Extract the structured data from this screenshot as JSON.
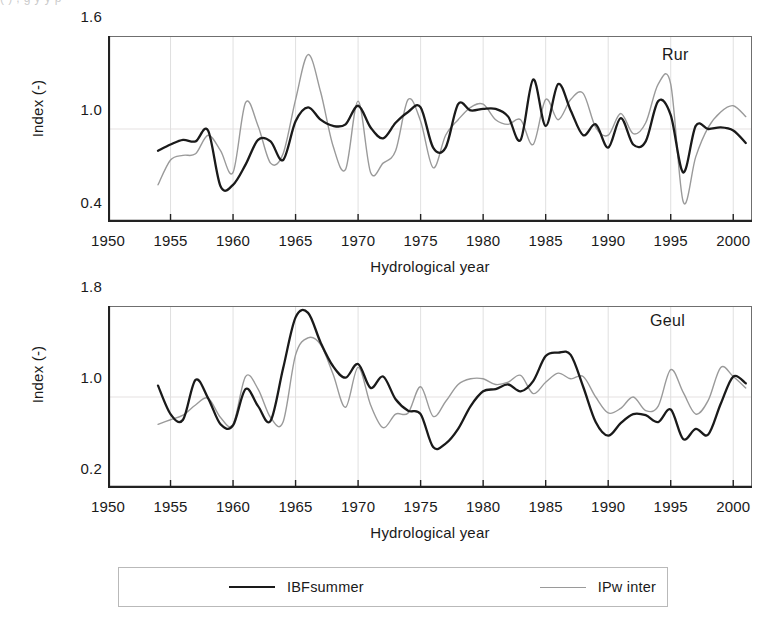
{
  "crop_artifact": {
    "text": "(  )   ,                                        g y            y  p"
  },
  "legend": {
    "entries": [
      {
        "label": "IBFsummer",
        "color": "#1a1a1a",
        "icon": "line-swatch"
      },
      {
        "label": "IPw inter",
        "color": "#9a9a9a",
        "icon": "line-swatch"
      }
    ]
  },
  "chart_data": [
    {
      "type": "line",
      "title": "Rur",
      "xlabel": "Hydrological year",
      "ylabel": "Index (-)",
      "xlim": [
        1950,
        2001.5
      ],
      "ylim": [
        0.4,
        1.6
      ],
      "xticks": [
        1950,
        1955,
        1960,
        1965,
        1970,
        1975,
        1980,
        1985,
        1990,
        1995,
        2000
      ],
      "yticks": [
        0.4,
        1.0,
        1.6
      ],
      "grid": true,
      "legend_position": "bottom-shared",
      "x": [
        1954,
        1955,
        1956,
        1957,
        1958,
        1959,
        1960,
        1961,
        1962,
        1963,
        1964,
        1965,
        1966,
        1967,
        1968,
        1969,
        1970,
        1971,
        1972,
        1973,
        1974,
        1975,
        1976,
        1977,
        1978,
        1979,
        1980,
        1981,
        1982,
        1983,
        1984,
        1985,
        1986,
        1987,
        1988,
        1989,
        1990,
        1991,
        1992,
        1993,
        1994,
        1995,
        1996,
        1997,
        1998,
        1999,
        2000,
        2001
      ],
      "series": [
        {
          "name": "IBFsummer",
          "color": "#1a1a1a",
          "values": [
            0.86,
            0.9,
            0.93,
            0.92,
            0.99,
            0.63,
            0.64,
            0.77,
            0.93,
            0.92,
            0.8,
            1.05,
            1.14,
            1.06,
            1.02,
            1.03,
            1.15,
            1.01,
            0.94,
            1.04,
            1.11,
            1.14,
            0.88,
            0.88,
            1.16,
            1.12,
            1.13,
            1.13,
            1.08,
            0.93,
            1.32,
            1.02,
            1.29,
            1.12,
            0.96,
            1.03,
            0.88,
            1.07,
            0.9,
            0.92,
            1.18,
            1.09,
            0.72,
            1.02,
            1.0,
            1.01,
            0.99,
            0.91
          ]
        },
        {
          "name": "IPw inter",
          "color": "#9a9a9a",
          "values": [
            0.64,
            0.8,
            0.83,
            0.84,
            0.96,
            0.86,
            0.72,
            1.17,
            1.02,
            0.78,
            0.84,
            1.19,
            1.48,
            1.24,
            0.89,
            0.74,
            1.18,
            0.72,
            0.78,
            0.86,
            1.19,
            1.05,
            0.75,
            0.96,
            1.06,
            1.14,
            1.16,
            1.06,
            1.03,
            1.06,
            0.9,
            1.19,
            1.06,
            1.19,
            1.23,
            1.01,
            0.96,
            1.1,
            0.97,
            1.04,
            1.29,
            1.29,
            0.53,
            0.82,
            1.01,
            1.11,
            1.15,
            1.08
          ]
        }
      ]
    },
    {
      "type": "line",
      "title": "Geul",
      "xlabel": "Hydrological year",
      "ylabel": "Index (-)",
      "xlim": [
        1950,
        2001.5
      ],
      "ylim": [
        0.2,
        1.8
      ],
      "xticks": [
        1950,
        1955,
        1960,
        1965,
        1970,
        1975,
        1980,
        1985,
        1990,
        1995,
        2000
      ],
      "yticks": [
        0.2,
        1.0,
        1.8
      ],
      "grid": true,
      "legend_position": "bottom-shared",
      "x": [
        1954,
        1955,
        1956,
        1957,
        1958,
        1959,
        1960,
        1961,
        1962,
        1963,
        1964,
        1965,
        1966,
        1967,
        1968,
        1969,
        1970,
        1971,
        1972,
        1973,
        1974,
        1975,
        1976,
        1977,
        1978,
        1979,
        1980,
        1981,
        1982,
        1983,
        1984,
        1985,
        1986,
        1987,
        1988,
        1989,
        1990,
        1991,
        1992,
        1993,
        1994,
        1995,
        1996,
        1997,
        1998,
        1999,
        2000,
        2001
      ],
      "series": [
        {
          "name": "IBFsummer",
          "color": "#1a1a1a",
          "values": [
            1.1,
            0.85,
            0.8,
            1.15,
            0.99,
            0.76,
            0.75,
            1.07,
            0.92,
            0.79,
            1.25,
            1.7,
            1.74,
            1.48,
            1.27,
            1.17,
            1.29,
            1.08,
            1.18,
            0.98,
            0.88,
            0.85,
            0.56,
            0.59,
            0.72,
            0.92,
            1.05,
            1.07,
            1.11,
            1.05,
            1.14,
            1.36,
            1.39,
            1.37,
            1.09,
            0.78,
            0.66,
            0.77,
            0.85,
            0.84,
            0.78,
            0.89,
            0.63,
            0.72,
            0.67,
            0.94,
            1.18,
            1.12
          ]
        },
        {
          "name": "IPw inter",
          "color": "#9a9a9a",
          "values": [
            0.76,
            0.8,
            0.84,
            0.93,
            0.99,
            0.82,
            0.76,
            1.18,
            1.07,
            0.82,
            0.78,
            1.37,
            1.52,
            1.46,
            1.2,
            0.91,
            1.26,
            0.93,
            0.73,
            0.85,
            0.86,
            1.09,
            0.83,
            0.96,
            1.11,
            1.16,
            1.16,
            1.11,
            1.13,
            1.19,
            1.03,
            1.13,
            1.21,
            1.16,
            1.18,
            1.0,
            0.86,
            0.9,
            1.0,
            0.88,
            0.92,
            1.24,
            1.04,
            0.85,
            0.97,
            1.26,
            1.18,
            1.08
          ]
        }
      ]
    }
  ]
}
